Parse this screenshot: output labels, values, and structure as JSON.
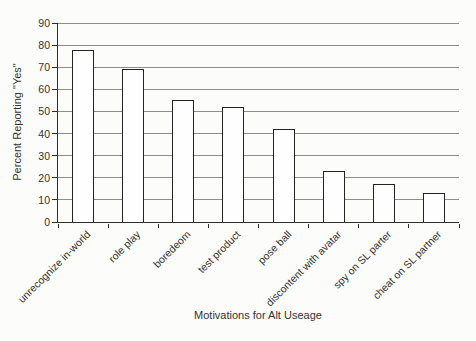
{
  "chart_data": {
    "type": "bar",
    "title": "",
    "xlabel": "Motivations for Alt Useage",
    "ylabel": "Percent Reporting \"Yes\"",
    "categories": [
      "unrecognize in-world",
      "role play",
      "boredeom",
      "test product",
      "pose ball",
      "discontent with avatar",
      "spy on SL parter",
      "cheat on SL partner"
    ],
    "values": [
      78,
      69,
      55,
      52,
      42,
      23,
      17,
      13
    ],
    "ylim": [
      0,
      90
    ],
    "ytick_step": 10,
    "ytick_labels": [
      "0",
      "10",
      "20",
      "30",
      "40",
      "50",
      "60",
      "70",
      "80",
      "90"
    ],
    "grid": true,
    "legend": "none",
    "colors": {
      "bar_fill": "#fefefe",
      "bar_border": "#232323",
      "gridline": "#8d8d8d",
      "axis": "#2e2e2e",
      "text": "#333333",
      "background": "#fcfcfa"
    }
  }
}
